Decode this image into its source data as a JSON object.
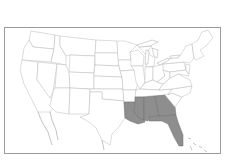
{
  "map": {
    "type": "choropleth",
    "region": "Contiguous United States",
    "highlight_color": "#8e8e8e",
    "base_color": "#ffffff",
    "border_color": "#b8b8b8",
    "highlighted_states": [
      "Louisiana",
      "Mississippi",
      "Alabama",
      "Georgia",
      "Florida"
    ]
  }
}
